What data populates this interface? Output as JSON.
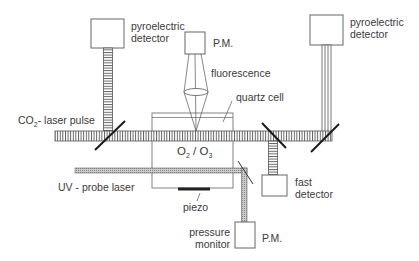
{
  "diagram": {
    "labels": {
      "pyro_left_1": "pyroelectric",
      "pyro_left_2": "detector",
      "pyro_right_1": "pyroelectric",
      "pyro_right_2": "detector",
      "pm_top": "P.M.",
      "fluorescence": "fluorescence",
      "quartz_cell": "quartz cell",
      "co2_prefix": "CO",
      "co2_sub": "2",
      "co2_suffix": "- laser pulse",
      "gas_o": "O",
      "gas_sub1": "2",
      "gas_sep": " / O",
      "gas_sub2": "3",
      "uv_probe": "UV - probe laser",
      "piezo": "piezo",
      "fast_1": "fast",
      "fast_2": "detector",
      "pressure_1": "pressure",
      "pressure_2": "monitor",
      "pm_bottom": "P.M."
    },
    "colors": {
      "line": "#555555",
      "beam_fill": "#ffffff",
      "uv_fill": "#bbbbbb",
      "mirror": "#1a1a1a"
    }
  }
}
